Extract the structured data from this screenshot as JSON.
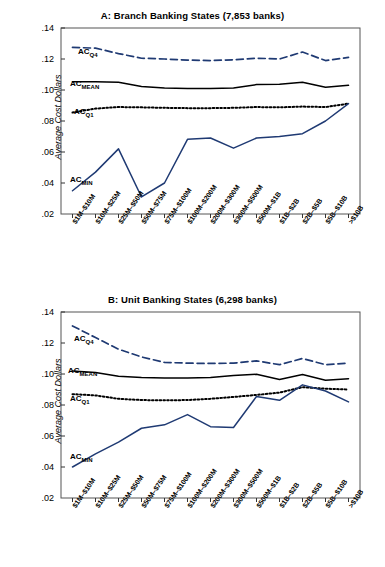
{
  "figure": {
    "ylabel": "Average Cost Dollars",
    "y_ticks": [
      ".02",
      ".04",
      ".06",
      ".08",
      ".10",
      ".12",
      ".14"
    ],
    "categories": [
      "$1M–$10M",
      "$10M–$25M",
      "$25M–$50M",
      "$50M–$75M",
      "$75M–$100M",
      "$100M–$200M",
      "$200M–$300M",
      "$300M–$500M",
      "$500M–$1B",
      "$1B–$2B",
      "$2B–$5B",
      "$5B–$10B",
      ">$10B"
    ],
    "colors": {
      "navy": "#1f3a73",
      "black": "#000000"
    },
    "series_labels": {
      "q4": "AC",
      "q4_sub": "Q4",
      "mean": "AC",
      "mean_sub": "MEAN",
      "q1": "AC",
      "q1_sub": "Q1",
      "min": "AC",
      "min_sub": "MIN"
    }
  },
  "chart_data": [
    {
      "type": "line",
      "title": "A: Branch Banking States (7,853 banks)",
      "xlabel": "",
      "ylabel": "Average Cost Dollars",
      "ylim": [
        0.02,
        0.14
      ],
      "grid": false,
      "legend": "inline-labels",
      "categories": [
        "$1M–$10M",
        "$10M–$25M",
        "$25M–$50M",
        "$50M–$75M",
        "$75M–$100M",
        "$100M–$200M",
        "$200M–$300M",
        "$300M–$500M",
        "$500M–$1B",
        "$1B–$2B",
        "$2B–$5B",
        "$5B–$10B",
        ">$10B"
      ],
      "series": [
        {
          "name": "AC_Q4",
          "style": "dashed",
          "color": "#1f3a73",
          "values": [
            0.1275,
            0.127,
            0.1235,
            0.1205,
            0.12,
            0.1193,
            0.119,
            0.1195,
            0.1205,
            0.12,
            0.1245,
            0.119,
            0.121
          ]
        },
        {
          "name": "AC_MEAN",
          "style": "solid",
          "color": "#000000",
          "values": [
            0.1053,
            0.1053,
            0.105,
            0.1022,
            0.1013,
            0.101,
            0.101,
            0.1013,
            0.1035,
            0.1037,
            0.105,
            0.1018,
            0.103
          ]
        },
        {
          "name": "AC_Q1",
          "style": "dotted",
          "color": "#000000",
          "values": [
            0.0855,
            0.088,
            0.089,
            0.0888,
            0.0885,
            0.0883,
            0.0883,
            0.0885,
            0.089,
            0.0888,
            0.0893,
            0.089,
            0.0912
          ]
        },
        {
          "name": "AC_MIN",
          "style": "solid",
          "color": "#1f3a73",
          "values": [
            0.035,
            0.047,
            0.062,
            0.031,
            0.04,
            0.0682,
            0.069,
            0.0625,
            0.069,
            0.07,
            0.0718,
            0.08,
            0.0912
          ]
        }
      ]
    },
    {
      "type": "line",
      "title": "B: Unit Banking States (6,298 banks)",
      "xlabel": "",
      "ylabel": "Average Cost Dollars",
      "ylim": [
        0.02,
        0.14
      ],
      "grid": false,
      "legend": "inline-labels",
      "categories": [
        "$1M–$10M",
        "$10M–$25M",
        "$25M–$50M",
        "$50M–$75M",
        "$75M–$100M",
        "$100M–$200M",
        "$200M–$300M",
        "$300M–$500M",
        "$500M–$1B",
        "$1B–$2B",
        "$2B–$5B",
        "$5B–$10B",
        ">$10B"
      ],
      "series": [
        {
          "name": "AC_Q4",
          "style": "dashed",
          "color": "#1f3a73",
          "values": [
            0.131,
            0.1235,
            0.116,
            0.111,
            0.1075,
            0.107,
            0.1068,
            0.107,
            0.1085,
            0.106,
            0.11,
            0.106,
            0.107
          ]
        },
        {
          "name": "AC_MEAN",
          "style": "solid",
          "color": "#000000",
          "values": [
            0.102,
            0.101,
            0.0985,
            0.0978,
            0.0975,
            0.0975,
            0.0978,
            0.099,
            0.0998,
            0.0965,
            0.0997,
            0.096,
            0.097
          ]
        },
        {
          "name": "AC_Q1",
          "style": "dotted",
          "color": "#000000",
          "values": [
            0.087,
            0.0862,
            0.084,
            0.0832,
            0.083,
            0.0832,
            0.084,
            0.0852,
            0.0865,
            0.088,
            0.0915,
            0.0905,
            0.09
          ]
        },
        {
          "name": "AC_MIN",
          "style": "solid",
          "color": "#1f3a73",
          "values": [
            0.04,
            0.0485,
            0.056,
            0.065,
            0.0672,
            0.0738,
            0.066,
            0.0655,
            0.0855,
            0.083,
            0.093,
            0.089,
            0.082
          ]
        }
      ]
    }
  ]
}
